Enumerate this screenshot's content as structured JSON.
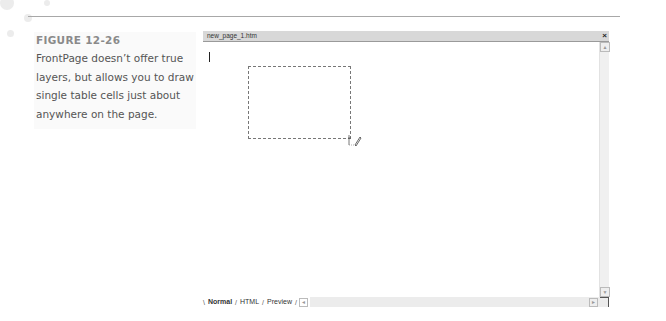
{
  "caption": {
    "figure_label": "FIGURE 12-26",
    "text": "FrontPage doesn’t offer true layers, but allows you to draw single table cells just about anywhere on the page."
  },
  "window": {
    "title": "new_page_1.htm",
    "close_icon": "×"
  },
  "editor": {
    "view_tabs": [
      {
        "label": "Normal",
        "active": true
      },
      {
        "label": "HTML",
        "active": false
      },
      {
        "label": "Preview",
        "active": false
      }
    ],
    "scroll_up": "▲",
    "scroll_down": "▼",
    "scroll_left": "◄",
    "scroll_right": "►"
  }
}
